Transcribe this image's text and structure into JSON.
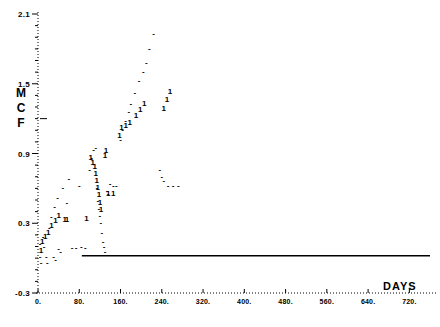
{
  "chart_data": {
    "type": "scatter",
    "title": "",
    "xlabel": "DAYS",
    "ylabel": "MCF",
    "xlim": [
      -40,
      760
    ],
    "ylim": [
      -0.3,
      2.1
    ],
    "grid": false,
    "legend": "none",
    "xticks": [
      "0.",
      "80.",
      "160.",
      "240.",
      "320.",
      "400.",
      "480.",
      "560.",
      "640.",
      "720."
    ],
    "xtick_values": [
      0,
      80,
      160,
      240,
      320,
      400,
      480,
      560,
      640,
      720
    ],
    "yticks": [
      "2.1",
      "1.5",
      "0.9",
      "0.3",
      "-0.3"
    ],
    "ytick_values": [
      2.1,
      1.5,
      0.9,
      0.3,
      -0.3
    ],
    "series": [
      {
        "name": "dash-series",
        "marker": "-",
        "points": [
          [
            4,
            0.12
          ],
          [
            4,
            0.01
          ],
          [
            6,
            -0.04
          ],
          [
            10,
            0.18
          ],
          [
            12,
            0.1
          ],
          [
            16,
            0.01
          ],
          [
            18,
            -0.04
          ],
          [
            22,
            0.26
          ],
          [
            26,
            0.35
          ],
          [
            30,
            0.01
          ],
          [
            32,
            0.44
          ],
          [
            34,
            -0.02
          ],
          [
            38,
            0.52
          ],
          [
            40,
            0.08
          ],
          [
            44,
            0.05
          ],
          [
            48,
            0.6
          ],
          [
            56,
            0.47
          ],
          [
            60,
            0.68
          ],
          [
            66,
            0.09
          ],
          [
            74,
            0.09
          ],
          [
            80,
            0.62
          ],
          [
            84,
            0.1
          ],
          [
            92,
            0.09
          ],
          [
            100,
            0.76
          ],
          [
            104,
            0.86
          ],
          [
            108,
            0.93
          ],
          [
            112,
            0.95
          ],
          [
            114,
            0.6
          ],
          [
            116,
            0.49
          ],
          [
            118,
            0.42
          ],
          [
            120,
            0.36
          ],
          [
            122,
            0.3
          ],
          [
            124,
            0.22
          ],
          [
            126,
            0.14
          ],
          [
            128,
            0.1
          ],
          [
            130,
            0.05
          ],
          [
            134,
            0.58
          ],
          [
            136,
            0.55
          ],
          [
            140,
            0.64
          ],
          [
            146,
            0.62
          ],
          [
            152,
            0.62
          ],
          [
            160,
            1.02
          ],
          [
            164,
            1.1
          ],
          [
            170,
            1.18
          ],
          [
            176,
            1.26
          ],
          [
            180,
            1.33
          ],
          [
            188,
            1.42
          ],
          [
            196,
            1.52
          ],
          [
            204,
            1.6
          ],
          [
            210,
            1.68
          ],
          [
            216,
            1.8
          ],
          [
            224,
            1.93
          ],
          [
            236,
            0.76
          ],
          [
            240,
            0.7
          ],
          [
            244,
            0.66
          ],
          [
            252,
            0.62
          ],
          [
            262,
            0.62
          ],
          [
            272,
            0.62
          ]
        ]
      },
      {
        "name": "one-series",
        "marker": "1",
        "points": [
          [
            6,
            0.06
          ],
          [
            8,
            0.14
          ],
          [
            14,
            0.18
          ],
          [
            20,
            0.22
          ],
          [
            26,
            0.28
          ],
          [
            34,
            0.32
          ],
          [
            40,
            0.36
          ],
          [
            52,
            0.33
          ],
          [
            56,
            0.33
          ],
          [
            94,
            0.34
          ],
          [
            102,
            0.86
          ],
          [
            106,
            0.82
          ],
          [
            110,
            0.78
          ],
          [
            112,
            0.72
          ],
          [
            114,
            0.66
          ],
          [
            116,
            0.6
          ],
          [
            118,
            0.54
          ],
          [
            120,
            0.47
          ],
          [
            122,
            0.41
          ],
          [
            130,
            0.88
          ],
          [
            132,
            0.92
          ],
          [
            136,
            0.55
          ],
          [
            146,
            0.55
          ],
          [
            158,
            1.05
          ],
          [
            162,
            1.12
          ],
          [
            170,
            1.14
          ],
          [
            178,
            1.16
          ],
          [
            190,
            1.22
          ],
          [
            198,
            1.27
          ],
          [
            206,
            1.33
          ],
          [
            244,
            1.28
          ],
          [
            250,
            1.36
          ],
          [
            256,
            1.43
          ]
        ]
      }
    ],
    "trend_line": {
      "from": [
        85,
        0.02
      ],
      "to": [
        760,
        0.02
      ]
    }
  }
}
